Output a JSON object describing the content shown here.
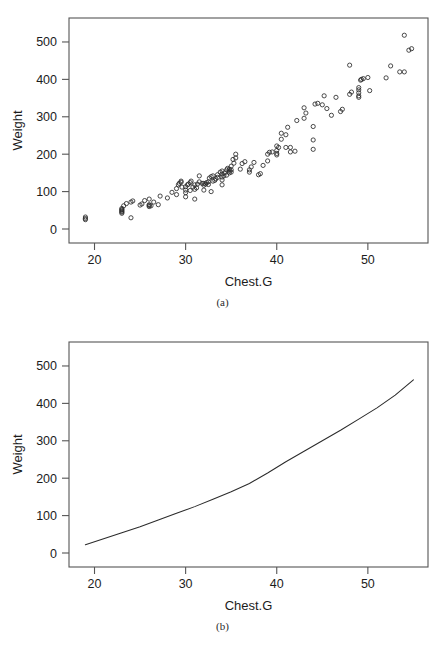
{
  "figure": {
    "panels": [
      {
        "id": "a",
        "caption": "(a)",
        "xlabel": "Chest.G",
        "ylabel": "Weight"
      },
      {
        "id": "b",
        "caption": "(b)",
        "xlabel": "Chest.G",
        "ylabel": "Weight"
      }
    ]
  },
  "chart_data": [
    {
      "type": "scatter",
      "title": "",
      "subtitle": "(a)",
      "xlabel": "Chest.G",
      "ylabel": "Weight",
      "xticks": [
        20,
        30,
        40,
        50
      ],
      "yticks": [
        0,
        100,
        200,
        300,
        400,
        500
      ],
      "xlim": [
        17.2,
        56.6
      ],
      "ylim": [
        -8,
        532
      ],
      "grid": false,
      "legend": "none",
      "marker": "open-circle",
      "x": [
        19.0,
        19.0,
        19.0,
        23.0,
        23.0,
        23.0,
        23.0,
        23.0,
        23.0,
        23.2,
        23.5,
        24.0,
        24.0,
        24.2,
        25.0,
        25.2,
        25.5,
        26.0,
        26.0,
        26.0,
        26.0,
        26.2,
        26.5,
        27.0,
        27.2,
        28.0,
        28.5,
        29.0,
        29.0,
        29.2,
        29.3,
        29.5,
        29.5,
        29.6,
        30.0,
        30.0,
        30.0,
        30.0,
        30.2,
        30.3,
        30.5,
        30.5,
        30.6,
        30.8,
        31.0,
        31.0,
        31.0,
        31.2,
        31.3,
        31.5,
        31.5,
        31.8,
        32.0,
        32.0,
        32.0,
        32.2,
        32.3,
        32.5,
        32.5,
        32.6,
        32.8,
        32.8,
        33.0,
        33.0,
        33.2,
        33.3,
        33.5,
        33.5,
        33.8,
        34.0,
        34.0,
        34.0,
        34.0,
        34.0,
        34.2,
        34.3,
        34.5,
        34.5,
        34.6,
        34.8,
        34.8,
        34.8,
        35.0,
        35.0,
        35.0,
        35.2,
        35.3,
        35.5,
        35.5,
        36.0,
        36.2,
        36.5,
        37.0,
        37.0,
        37.2,
        37.5,
        38.0,
        38.2,
        38.5,
        39.0,
        39.0,
        39.2,
        39.5,
        40.0,
        40.0,
        40.0,
        40.0,
        40.2,
        40.5,
        40.5,
        41.0,
        41.0,
        41.2,
        41.5,
        41.5,
        42.0,
        42.2,
        43.0,
        43.0,
        43.2,
        44.0,
        44.0,
        44.0,
        44.2,
        44.5,
        45.0,
        45.2,
        45.5,
        46.0,
        46.5,
        47.0,
        47.2,
        48.0,
        48.0,
        48.2,
        49.0,
        49.0,
        49.0,
        49.0,
        49.0,
        49.2,
        49.3,
        49.5,
        50.0,
        50.2,
        52.0,
        52.5,
        53.5,
        54.0,
        54.0,
        54.5,
        54.8
      ],
      "y": [
        28.0,
        32.0,
        25.0,
        42.0,
        45.0,
        47.0,
        50.0,
        52.0,
        55.0,
        62.0,
        68.0,
        30.0,
        72.0,
        75.0,
        64.0,
        67.0,
        76.0,
        60.0,
        63.0,
        65.0,
        80.0,
        62.0,
        72.0,
        65.0,
        88.0,
        83.0,
        98.0,
        92.0,
        108.0,
        118.0,
        122.0,
        125.0,
        128.0,
        112.0,
        86.0,
        97.0,
        104.0,
        113.0,
        118.0,
        120.0,
        103.0,
        124.0,
        128.0,
        112.0,
        80.0,
        106.0,
        118.0,
        110.0,
        120.0,
        126.0,
        142.0,
        122.0,
        104.0,
        117.0,
        122.0,
        120.0,
        124.0,
        119.0,
        126.0,
        136.0,
        100.0,
        140.0,
        128.0,
        142.0,
        130.0,
        134.0,
        138.0,
        145.0,
        152.0,
        118.0,
        131.0,
        139.0,
        147.0,
        155.0,
        142.0,
        150.0,
        144.0,
        158.0,
        162.0,
        150.0,
        155.0,
        160.0,
        152.0,
        158.0,
        168.0,
        186.0,
        176.0,
        190.0,
        200.0,
        160.0,
        175.0,
        180.0,
        152.0,
        158.0,
        166.0,
        178.0,
        145.0,
        148.0,
        170.0,
        182.0,
        200.0,
        205.0,
        206.0,
        198.0,
        202.0,
        210.0,
        222.0,
        218.0,
        240.0,
        256.0,
        218.0,
        252.0,
        272.0,
        206.0,
        218.0,
        208.0,
        290.0,
        296.0,
        324.0,
        310.0,
        213.0,
        238.0,
        274.0,
        334.0,
        336.0,
        332.0,
        356.0,
        322.0,
        304.0,
        352.0,
        314.0,
        320.0,
        438.0,
        360.0,
        366.0,
        352.0,
        356.0,
        364.0,
        372.0,
        378.0,
        398.0,
        400.0,
        402.0,
        405.0,
        370.0,
        404.0,
        436.0,
        420.0,
        518.0,
        420.0,
        478.0,
        482.0,
        450.0
      ]
    },
    {
      "type": "line",
      "title": "",
      "subtitle": "(b)",
      "xlabel": "Chest.G",
      "ylabel": "Weight",
      "xticks": [
        20,
        30,
        40,
        50
      ],
      "yticks": [
        0,
        100,
        200,
        300,
        400,
        500
      ],
      "xlim": [
        17.2,
        56.6
      ],
      "ylim": [
        -8,
        532
      ],
      "grid": false,
      "legend": "none",
      "series": [
        {
          "name": "fitted",
          "x": [
            19.0,
            21.0,
            23.0,
            25.0,
            27.0,
            29.0,
            31.0,
            33.0,
            35.0,
            37.0,
            39.0,
            41.0,
            43.0,
            45.0,
            47.0,
            49.0,
            51.0,
            53.0,
            55.0
          ],
          "values": [
            22,
            38,
            54,
            70,
            88,
            106,
            124,
            144,
            164,
            186,
            214,
            244,
            272,
            300,
            328,
            358,
            388,
            422,
            463
          ]
        }
      ]
    }
  ]
}
